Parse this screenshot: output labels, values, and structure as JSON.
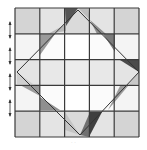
{
  "figure": {
    "caption": "· ·",
    "grid": {
      "x0": 15,
      "y0": 8,
      "cell_w": 24.8,
      "cell_h": 25.8,
      "rows": 5,
      "cols": 5,
      "line_color": "#3a3a3a",
      "fills": [
        [
          "#d4d4d4",
          "#e4e4e4",
          "#dadada",
          "#e4e4e4",
          "#d4d4d4"
        ],
        [
          "#f4f4f4",
          "#fbfbfb",
          "#ffffff",
          "#fbfbfb",
          "#f4f4f4"
        ],
        [
          "#e4e4e4",
          "#e8e8e8",
          "#ececec",
          "#e8e8e8",
          "#e4e4e4"
        ],
        [
          "#f4f4f4",
          "#fbfbfb",
          "#ffffff",
          "#fbfbfb",
          "#f4f4f4"
        ],
        [
          "#d4d4d4",
          "#e4e4e4",
          "#dadada",
          "#e4e4e4",
          "#d4d4d4"
        ]
      ]
    },
    "outline": {
      "color": "#333333",
      "points": [
        [
          78,
          10
        ],
        [
          139,
          72
        ],
        [
          80,
          135
        ],
        [
          17,
          72
        ]
      ]
    },
    "triangles": [
      {
        "name": "top-dark",
        "color": "#555555",
        "points": [
          [
            65,
            8
          ],
          [
            78,
            8
          ],
          [
            66,
            26
          ]
        ]
      },
      {
        "name": "top-light",
        "color": "#bdbdbd",
        "points": [
          [
            78,
            8
          ],
          [
            88,
            8
          ],
          [
            90,
            20
          ]
        ]
      },
      {
        "name": "top-left-mid",
        "color": "#9a9a9a",
        "points": [
          [
            40,
            34
          ],
          [
            55,
            34
          ],
          [
            40,
            55
          ]
        ]
      },
      {
        "name": "top-left-light",
        "color": "#b8b8b8",
        "points": [
          [
            48,
            34
          ],
          [
            66,
            24
          ],
          [
            66,
            31
          ]
        ]
      },
      {
        "name": "top-right-mid",
        "color": "#8c8c8c",
        "points": [
          [
            90,
            20
          ],
          [
            97,
            34
          ],
          [
            106,
            34
          ]
        ]
      },
      {
        "name": "top-right-mid2",
        "color": "#7a7a7a",
        "points": [
          [
            103,
            34
          ],
          [
            115,
            34
          ],
          [
            115,
            52
          ]
        ]
      },
      {
        "name": "right-dark",
        "color": "#4a4a4a",
        "points": [
          [
            120,
            60
          ],
          [
            139,
            60
          ],
          [
            139,
            72
          ]
        ]
      },
      {
        "name": "left-light",
        "color": "#cfcfcf",
        "points": [
          [
            17,
            72
          ],
          [
            33,
            84
          ],
          [
            17,
            84
          ]
        ]
      },
      {
        "name": "left-mid",
        "color": "#9a9a9a",
        "points": [
          [
            20,
            85
          ],
          [
            40,
            85
          ],
          [
            40,
            96
          ]
        ]
      },
      {
        "name": "bottom-left-mid",
        "color": "#8f8f8f",
        "points": [
          [
            40,
            97
          ],
          [
            40,
            110
          ],
          [
            60,
            110
          ]
        ]
      },
      {
        "name": "right-light",
        "color": "#c8c8c8",
        "points": [
          [
            139,
            72
          ],
          [
            128,
            85
          ],
          [
            139,
            84
          ]
        ]
      },
      {
        "name": "right-mid",
        "color": "#9c9c9c",
        "points": [
          [
            120,
            86
          ],
          [
            128,
            86
          ],
          [
            108,
            110
          ]
        ]
      },
      {
        "name": "bottom-dark",
        "color": "#3f3f3f",
        "points": [
          [
            90,
            112
          ],
          [
            102,
            112
          ],
          [
            90,
            135
          ]
        ]
      },
      {
        "name": "bottom-mid",
        "color": "#707070",
        "points": [
          [
            90,
            112
          ],
          [
            80,
            135
          ],
          [
            90,
            137
          ]
        ]
      },
      {
        "name": "bottom-light",
        "color": "#c4c4c4",
        "points": [
          [
            65,
            112
          ],
          [
            80,
            135
          ],
          [
            65,
            130
          ]
        ]
      }
    ],
    "arrows": [
      {
        "y": 30
      },
      {
        "y": 56
      },
      {
        "y": 82
      },
      {
        "y": 108
      }
    ],
    "arrow_color": "#333333"
  }
}
